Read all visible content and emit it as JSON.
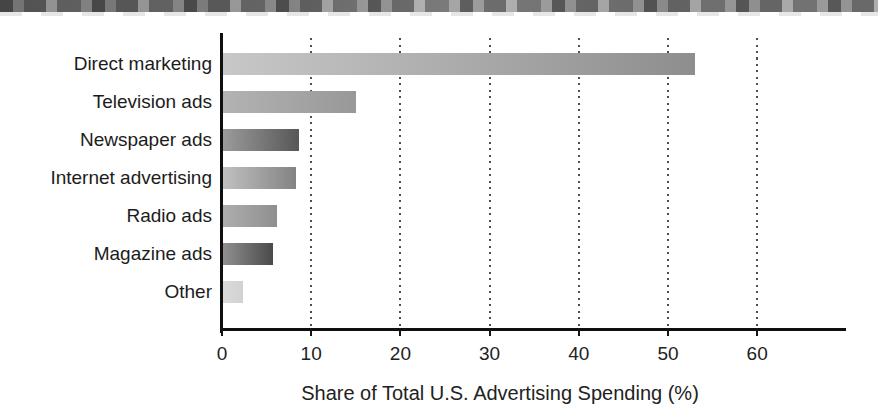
{
  "figure": {
    "background_color": "#ffffff",
    "scan_band": "dark-noisy-print-edge",
    "axis_color": "#0f0f0f",
    "gridline_color": "#4e4e4e",
    "text_color": "#1c1c1c"
  },
  "chart_data": {
    "type": "bar",
    "orientation": "horizontal",
    "title": "",
    "xlabel": "Share of Total U.S. Advertising Spending (%)",
    "ylabel": "",
    "xlim": [
      0,
      70
    ],
    "x_ticks": [
      0,
      10,
      20,
      30,
      40,
      50,
      60
    ],
    "grid": "dotted-vertical",
    "legend": "none",
    "categories": [
      "Direct marketing",
      "Television ads",
      "Newspaper ads",
      "Internet advertising",
      "Radio ads",
      "Magazine ads",
      "Other"
    ],
    "values": [
      53,
      15,
      8.6,
      8.3,
      6.2,
      5.7,
      2.4
    ],
    "bar_gradients": [
      [
        "#c8c8c8",
        "#8e8e8e"
      ],
      [
        "#b3b3b3",
        "#989898"
      ],
      [
        "#9c9c9c",
        "#575757"
      ],
      [
        "#c1c1c1",
        "#838383"
      ],
      [
        "#aeaeae",
        "#8f8f8f"
      ],
      [
        "#919191",
        "#4a4a4a"
      ],
      [
        "#dbdbdb",
        "#d2d2d2"
      ]
    ]
  }
}
